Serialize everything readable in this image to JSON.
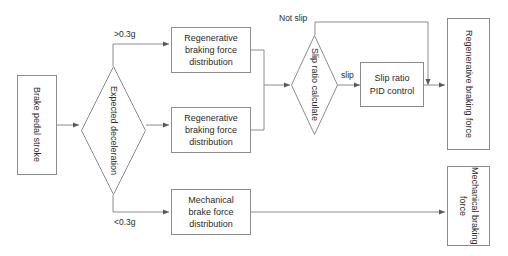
{
  "diagram": {
    "stroke_color": "#8c8c8c",
    "text_color": "#2b2b2b",
    "background": "#ffffff",
    "nodes": {
      "brake_pedal_stroke": "Brake pedal stroke",
      "expected_deceleration": "Expected deceleration",
      "regen_dist_top": "Regenerative\nbraking force\ndistribution",
      "regen_dist_mid": "Regenerative\nbraking force\ndistribution",
      "mechanical_dist": "Mechanical\nbrake force\ndistribution",
      "slip_ratio_calculate": "Slip ratio calculate",
      "slip_ratio_pid": "Slip ratio\nPID control",
      "regen_braking_force": "Regenerative braking force",
      "mechanical_braking_force": "Mechanical braking force"
    },
    "edge_labels": {
      "gt_03g": ">0.3g",
      "lt_03g": "<0.3g",
      "not_slip": "Not slip",
      "slip": "slip"
    }
  }
}
